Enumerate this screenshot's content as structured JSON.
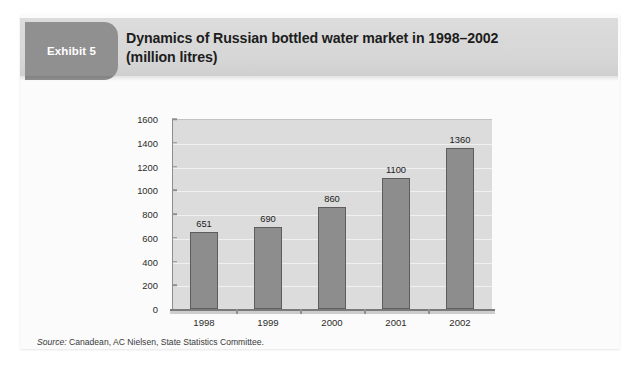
{
  "exhibit": {
    "badge_label": "Exhibit 5",
    "title_line1": "Dynamics of Russian bottled water market in 1998–2002",
    "title_line2": "(million litres)",
    "source_label": "Source:",
    "source_text": " Canadean, AC Nielsen, State Statistics Committee."
  },
  "chart_data": {
    "type": "bar",
    "title": "Dynamics of Russian bottled water market in 1998–2002 (million litres)",
    "categories": [
      "1998",
      "1999",
      "2000",
      "2001",
      "2002"
    ],
    "values": [
      651,
      690,
      860,
      1100,
      1360
    ],
    "value_labels": [
      "651",
      "690",
      "860",
      "1100",
      "1360"
    ],
    "xlabel": "",
    "ylabel": "",
    "ylim": [
      0,
      1600
    ],
    "ytick_step": 200,
    "yticks": [
      0,
      200,
      400,
      600,
      800,
      1000,
      1200,
      1400,
      1600
    ],
    "ytick_labels": [
      "0",
      "200",
      "400",
      "600",
      "800",
      "1000",
      "1200",
      "1400",
      "1600"
    ],
    "grid": true,
    "legend": "none",
    "series_color": "#8d8d8d",
    "plot_background": "#dcdcdc",
    "gridline_color": "#f0f0f0"
  },
  "colors": {
    "badge_background": "#909090",
    "header_background": "#d7d7d7",
    "card_background": "#fbfbfb",
    "title_text": "#1d1d1d",
    "axis": "#8e8e8e"
  }
}
